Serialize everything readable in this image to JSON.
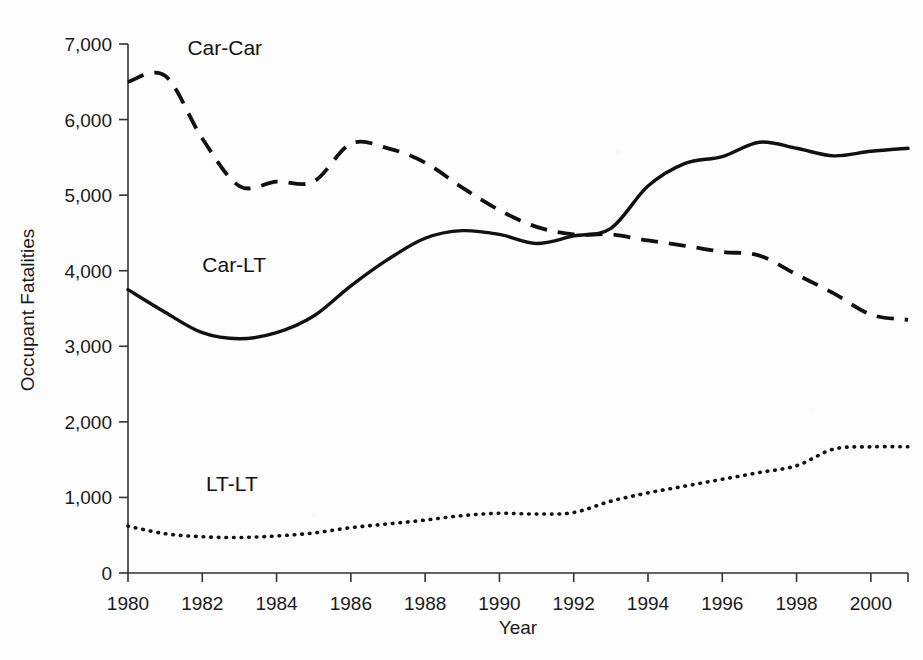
{
  "chart_data": {
    "type": "line",
    "title": "",
    "xlabel": "Year",
    "ylabel": "Occupant Fatalities",
    "xlim": [
      1980,
      2001
    ],
    "ylim": [
      0,
      7000
    ],
    "grid": false,
    "legend_position": "inline-annotations",
    "x": [
      1980,
      1981,
      1982,
      1983,
      1984,
      1985,
      1986,
      1987,
      1988,
      1989,
      1990,
      1991,
      1992,
      1993,
      1994,
      1995,
      1996,
      1997,
      1998,
      1999,
      2000,
      2001
    ],
    "xticks": [
      "1980",
      "1982",
      "1984",
      "1986",
      "1988",
      "1990",
      "1992",
      "1994",
      "1996",
      "1998",
      "2000"
    ],
    "yticks": [
      "0",
      "1,000",
      "2,000",
      "3,000",
      "4,000",
      "5,000",
      "6,000",
      "7,000"
    ],
    "series": [
      {
        "name": "Car-Car",
        "style": "dashed",
        "color": "#111111",
        "label_x": 1981.6,
        "label_y": 6850,
        "values": [
          6500,
          6580,
          5750,
          5120,
          5180,
          5180,
          5680,
          5620,
          5430,
          5100,
          4800,
          4580,
          4480,
          4480,
          4400,
          4330,
          4250,
          4200,
          3950,
          3700,
          3420,
          3350
        ]
      },
      {
        "name": "Car-LT",
        "style": "solid",
        "color": "#111111",
        "label_x": 1982.0,
        "label_y": 3980,
        "values": [
          3750,
          3450,
          3180,
          3100,
          3180,
          3400,
          3800,
          4150,
          4430,
          4530,
          4480,
          4360,
          4460,
          4560,
          5120,
          5420,
          5510,
          5700,
          5620,
          5520,
          5580,
          5620
        ]
      },
      {
        "name": "LT-LT",
        "style": "dotted",
        "color": "#111111",
        "label_x": 1982.1,
        "label_y": 1090,
        "values": [
          620,
          520,
          480,
          470,
          490,
          530,
          600,
          650,
          700,
          760,
          790,
          780,
          800,
          950,
          1060,
          1150,
          1240,
          1330,
          1420,
          1640,
          1670,
          1670
        ]
      }
    ]
  }
}
